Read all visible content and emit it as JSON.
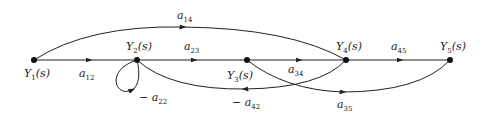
{
  "diagram": {
    "type": "signal-flow-graph",
    "nodes": [
      {
        "id": "Y1",
        "symbol": "Y",
        "sub": "1",
        "arg": "(s)",
        "x": 34,
        "y": 60
      },
      {
        "id": "Y2",
        "symbol": "Y",
        "sub": "2",
        "arg": "(s)",
        "x": 137,
        "y": 60
      },
      {
        "id": "Y3",
        "symbol": "Y",
        "sub": "3",
        "arg": "(s)",
        "x": 247,
        "y": 60
      },
      {
        "id": "Y4",
        "symbol": "Y",
        "sub": "4",
        "arg": "(s)",
        "x": 346,
        "y": 60
      },
      {
        "id": "Y5",
        "symbol": "Y",
        "sub": "5",
        "arg": "(s)",
        "x": 450,
        "y": 60
      }
    ],
    "edges": [
      {
        "from": "Y1",
        "to": "Y2",
        "gain": {
          "prefix": "",
          "symbol": "a",
          "sub": "12"
        }
      },
      {
        "from": "Y2",
        "to": "Y3",
        "gain": {
          "prefix": "",
          "symbol": "a",
          "sub": "23"
        }
      },
      {
        "from": "Y3",
        "to": "Y4",
        "gain": {
          "prefix": "",
          "symbol": "a",
          "sub": "34"
        }
      },
      {
        "from": "Y4",
        "to": "Y5",
        "gain": {
          "prefix": "",
          "symbol": "a",
          "sub": "45"
        }
      },
      {
        "from": "Y1",
        "to": "Y4",
        "gain": {
          "prefix": "",
          "symbol": "a",
          "sub": "14"
        }
      },
      {
        "from": "Y2",
        "to": "Y2",
        "gain": {
          "prefix": "−",
          "symbol": "a",
          "sub": "22"
        }
      },
      {
        "from": "Y4",
        "to": "Y2",
        "gain": {
          "prefix": "−",
          "symbol": "a",
          "sub": "42"
        }
      },
      {
        "from": "Y3",
        "to": "Y5",
        "gain": {
          "prefix": "",
          "symbol": "a",
          "sub": "35"
        }
      }
    ],
    "colors": {
      "line": "#222222",
      "node": "#111111",
      "background": "#ffffff"
    }
  }
}
